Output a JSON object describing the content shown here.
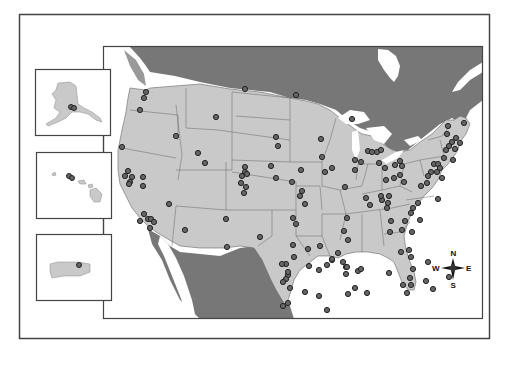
{
  "map": {
    "title": "",
    "colors": {
      "background": "#ffffff",
      "us_land": "#c9c9c9",
      "foreign_land": "#777777",
      "water": "#ffffff",
      "borders": "#555555",
      "frame": "#444444",
      "marker_fill": "#666666",
      "marker_stroke": "#222222"
    },
    "insets": [
      {
        "name": "Alaska",
        "marker_count": 2
      },
      {
        "name": "Hawaii",
        "marker_count": 2
      },
      {
        "name": "Puerto Rico",
        "marker_count": 1
      }
    ],
    "compass": {
      "n": "N",
      "s": "S",
      "e": "E",
      "w": "W"
    },
    "markers": [
      [
        146,
        92
      ],
      [
        144,
        98
      ],
      [
        140,
        110
      ],
      [
        176,
        136
      ],
      [
        122,
        147
      ],
      [
        128,
        171
      ],
      [
        125,
        176
      ],
      [
        132,
        177
      ],
      [
        130,
        182
      ],
      [
        143,
        177
      ],
      [
        129,
        184
      ],
      [
        143,
        186
      ],
      [
        144,
        214
      ],
      [
        148,
        219
      ],
      [
        140,
        221
      ],
      [
        151,
        219
      ],
      [
        154,
        222
      ],
      [
        150,
        228
      ],
      [
        169,
        204
      ],
      [
        185,
        230
      ],
      [
        198,
        153
      ],
      [
        216,
        117
      ],
      [
        205,
        163
      ],
      [
        226,
        219
      ],
      [
        227,
        247
      ],
      [
        245,
        89
      ],
      [
        245,
        167
      ],
      [
        245,
        172
      ],
      [
        242,
        176
      ],
      [
        247,
        174
      ],
      [
        241,
        183
      ],
      [
        246,
        187
      ],
      [
        244,
        193
      ],
      [
        260,
        237
      ],
      [
        271,
        166
      ],
      [
        276,
        178
      ],
      [
        296,
        95
      ],
      [
        276,
        137
      ],
      [
        278,
        146
      ],
      [
        292,
        182
      ],
      [
        293,
        218
      ],
      [
        301,
        170
      ],
      [
        302,
        191
      ],
      [
        300,
        196
      ],
      [
        305,
        204
      ],
      [
        321,
        139
      ],
      [
        322,
        157
      ],
      [
        325,
        172
      ],
      [
        332,
        168
      ],
      [
        352,
        119
      ],
      [
        345,
        187
      ],
      [
        347,
        218
      ],
      [
        344,
        231
      ],
      [
        348,
        240
      ],
      [
        338,
        253
      ],
      [
        343,
        262
      ],
      [
        346,
        267
      ],
      [
        320,
        246
      ],
      [
        327,
        265
      ],
      [
        308,
        249
      ],
      [
        309,
        266
      ],
      [
        319,
        270
      ],
      [
        332,
        260
      ],
      [
        346,
        274
      ],
      [
        347,
        267
      ],
      [
        332,
        259
      ],
      [
        293,
        245
      ],
      [
        296,
        224
      ],
      [
        355,
        160
      ],
      [
        361,
        162
      ],
      [
        355,
        170
      ],
      [
        368,
        151
      ],
      [
        372,
        152
      ],
      [
        377,
        152
      ],
      [
        379,
        163
      ],
      [
        381,
        150
      ],
      [
        366,
        198
      ],
      [
        370,
        205
      ],
      [
        382,
        200
      ],
      [
        381,
        196
      ],
      [
        388,
        203
      ],
      [
        387,
        208
      ],
      [
        386,
        180
      ],
      [
        385,
        168
      ],
      [
        389,
        196
      ],
      [
        394,
        178
      ],
      [
        395,
        165
      ],
      [
        400,
        175
      ],
      [
        404,
        182
      ],
      [
        391,
        221
      ],
      [
        405,
        221
      ],
      [
        402,
        230
      ],
      [
        390,
        232
      ],
      [
        401,
        252
      ],
      [
        413,
        208
      ],
      [
        420,
        220
      ],
      [
        438,
        199
      ],
      [
        442,
        178
      ],
      [
        428,
        176
      ],
      [
        431,
        172
      ],
      [
        437,
        172
      ],
      [
        434,
        164
      ],
      [
        438,
        164
      ],
      [
        440,
        168
      ],
      [
        444,
        158
      ],
      [
        446,
        150
      ],
      [
        449,
        146
      ],
      [
        447,
        134
      ],
      [
        452,
        142
      ],
      [
        456,
        138
      ],
      [
        448,
        126
      ],
      [
        460,
        143
      ],
      [
        464,
        123
      ],
      [
        455,
        149
      ],
      [
        453,
        160
      ],
      [
        400,
        161
      ],
      [
        402,
        166
      ],
      [
        421,
        186
      ],
      [
        427,
        183
      ],
      [
        418,
        203
      ],
      [
        411,
        213
      ],
      [
        412,
        232
      ],
      [
        409,
        250
      ],
      [
        411,
        257
      ],
      [
        413,
        269
      ],
      [
        410,
        278
      ],
      [
        411,
        285
      ],
      [
        426,
        281
      ],
      [
        433,
        289
      ],
      [
        428,
        262
      ],
      [
        449,
        277
      ],
      [
        288,
        275
      ],
      [
        286,
        279
      ],
      [
        288,
        272
      ],
      [
        286,
        264
      ],
      [
        282,
        264
      ],
      [
        294,
        257
      ],
      [
        283,
        282
      ],
      [
        290,
        288
      ],
      [
        283,
        306
      ],
      [
        288,
        303
      ],
      [
        305,
        292
      ],
      [
        327,
        310
      ],
      [
        319,
        296
      ],
      [
        348,
        294
      ],
      [
        355,
        288
      ],
      [
        358,
        271
      ],
      [
        361,
        269
      ],
      [
        389,
        273
      ],
      [
        403,
        285
      ],
      [
        407,
        293
      ],
      [
        367,
        293
      ]
    ]
  }
}
